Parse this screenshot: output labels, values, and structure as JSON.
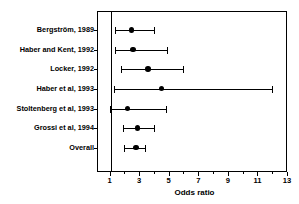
{
  "chart_data": {
    "type": "forest",
    "title": "",
    "xlabel": "Odds ratio",
    "ylabel": "",
    "xlim": [
      0.25,
      13
    ],
    "xticks": [
      1,
      3,
      5,
      7,
      9,
      11,
      13
    ],
    "xticklabels": [
      "1",
      "3",
      "5",
      "7",
      "9",
      "11",
      "13"
    ],
    "reference_line": 1,
    "grid": false,
    "legend": null,
    "categories": [
      "Bergström, 1989",
      "Haber and Kent, 1992",
      "Locker, 1992",
      "Haber et al, 1993",
      "Stoltenberg et al, 1993",
      "Grossi et al, 1994",
      "Overall"
    ],
    "values": [
      2.5,
      2.6,
      3.6,
      4.5,
      2.2,
      2.9,
      2.8
    ],
    "ci_low": [
      1.35,
      1.35,
      1.8,
      1.3,
      1.0,
      1.9,
      2.0
    ],
    "ci_high": [
      4.0,
      4.9,
      6.0,
      12.0,
      4.8,
      4.0,
      3.4
    ],
    "points": [
      {
        "label": "Bergström, 1989",
        "or": 2.5,
        "lcl": 1.35,
        "ucl": 4.0
      },
      {
        "label": "Haber and Kent, 1992",
        "or": 2.6,
        "lcl": 1.35,
        "ucl": 4.9
      },
      {
        "label": "Locker, 1992",
        "or": 3.6,
        "lcl": 1.8,
        "ucl": 6.0
      },
      {
        "label": "Haber et al, 1993",
        "or": 4.5,
        "lcl": 1.3,
        "ucl": 12.0
      },
      {
        "label": "Stoltenberg et al, 1993",
        "or": 2.2,
        "lcl": 1.0,
        "ucl": 4.8
      },
      {
        "label": "Grossi et al, 1994",
        "or": 2.9,
        "lcl": 1.9,
        "ucl": 4.0
      },
      {
        "label": "Overall",
        "or": 2.8,
        "lcl": 2.0,
        "ucl": 3.4
      }
    ]
  },
  "colors": {
    "marker": "#000000",
    "line": "#000000",
    "axis": "#000000",
    "background": "#ffffff"
  },
  "axis": {
    "title": "Odds ratio"
  }
}
